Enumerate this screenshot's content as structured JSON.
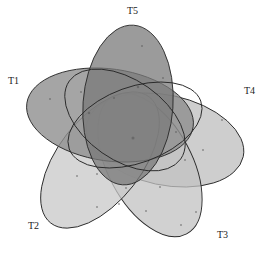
{
  "diagram": {
    "type": "venn",
    "set_count": 5,
    "sets": [
      {
        "id": "T1",
        "label": "T1",
        "fill": "#8c8c8c",
        "opacity": 0.75
      },
      {
        "id": "T2",
        "label": "T2",
        "fill": "#c4c4c4",
        "opacity": 0.75
      },
      {
        "id": "T3",
        "label": "T3",
        "fill": "#b8b8b8",
        "opacity": 0.7
      },
      {
        "id": "T4",
        "label": "T4",
        "fill": "#bdbdbd",
        "opacity": 0.7
      },
      {
        "id": "T5",
        "label": "T5",
        "fill": "#7e7e7e",
        "opacity": 0.75
      }
    ],
    "region_values_legible": false
  }
}
